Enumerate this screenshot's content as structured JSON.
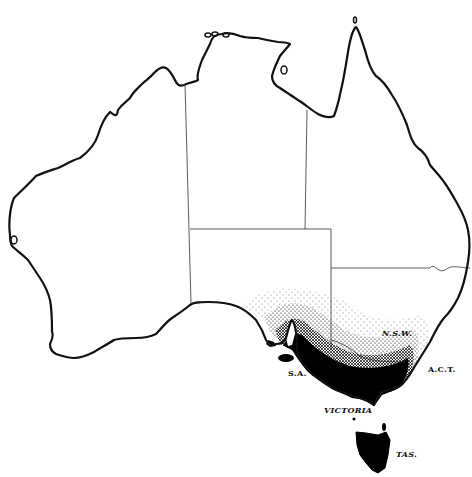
{
  "map": {
    "subject": "Australia",
    "style": "black-and-white outline map with stippled distribution shading",
    "colors": {
      "background": "#ffffff",
      "coastline": "#111111",
      "borders": "#333333",
      "shading": "#000000"
    },
    "labels": [
      {
        "id": "nsw",
        "text": "N.S.W.",
        "italic": true
      },
      {
        "id": "sa",
        "text": "S.A.",
        "italic": false
      },
      {
        "id": "act",
        "text": "A.C.T.",
        "italic": false
      },
      {
        "id": "vic",
        "text": "VICTORIA",
        "italic": true
      },
      {
        "id": "tas",
        "text": "TAS.",
        "italic": true
      }
    ],
    "shaded_region": "South-eastern Australia: south-east SA, Victoria, southern NSW, and Tasmania"
  }
}
